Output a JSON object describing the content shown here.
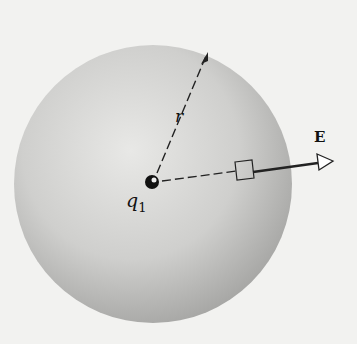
{
  "diagram": {
    "labels": {
      "charge": "q",
      "charge_subscript": "1",
      "radius": "r",
      "field": "E"
    },
    "colors": {
      "background": "#f2f2f0",
      "sphere_light": "#e6e6e4",
      "sphere_dark": "#a9a9a7",
      "ink": "#111111"
    }
  }
}
